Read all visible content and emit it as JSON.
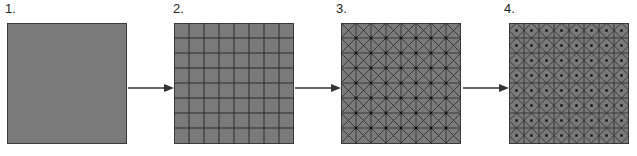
{
  "diagram": {
    "type": "process-sequence",
    "steps": [
      {
        "label": "1.",
        "description": "plain square",
        "grid": 0,
        "pattern": "none"
      },
      {
        "label": "2.",
        "description": "square divided into 8x8 grid",
        "grid": 8,
        "pattern": "grid"
      },
      {
        "label": "3.",
        "description": "8x8 grid with diagonals crossing each cell and dots at grid intersections",
        "grid": 8,
        "pattern": "grid-x-diagonals-vertex-dots"
      },
      {
        "label": "4.",
        "description": "8x8 grid with diamonds connecting edge midpoints and dots at cell centers",
        "grid": 8,
        "pattern": "grid-diamonds-center-dots"
      }
    ],
    "arrows": [
      {
        "from": "1.",
        "to": "2."
      },
      {
        "from": "2.",
        "to": "3."
      },
      {
        "from": "3.",
        "to": "4."
      }
    ],
    "colors": {
      "fill": "#7a7a7a",
      "line": "#2a2a2a",
      "border": "#3a3a3a",
      "arrow": "#333333"
    }
  }
}
